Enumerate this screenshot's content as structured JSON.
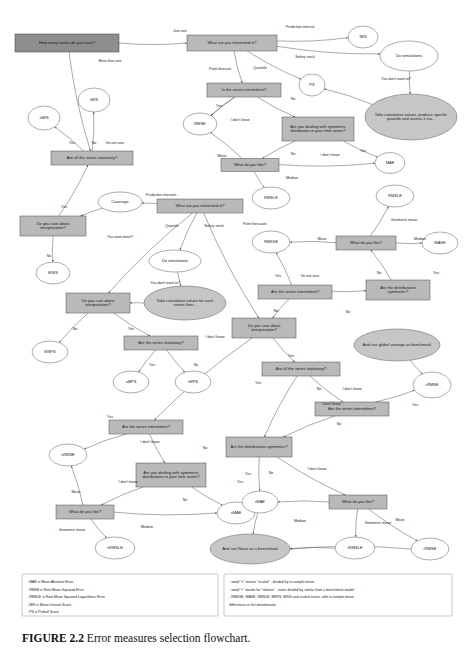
{
  "figure": {
    "caption_label": "FIGURE 2.2",
    "caption_text": "Error measures selection flowchart.",
    "bg": "#ffffff",
    "rect_fill": "#b9b9b9",
    "rect_dark_fill": "#8e8e8e",
    "ellipse_fill": "#ffffff",
    "ellipse_gray_fill": "#c6c6c6",
    "edge_color": "#555555"
  },
  "nodes": [
    {
      "id": "q_series_count",
      "label": "How many series do you have?",
      "shape": "rect-dark",
      "x": 67,
      "y": 43,
      "w": 104,
      "h": 18
    },
    {
      "id": "q_interested_top",
      "label": "What are you interested in?",
      "shape": "rect",
      "x": 232,
      "y": 43,
      "w": 90,
      "h": 16
    },
    {
      "id": "n_mis",
      "label": "MIS",
      "shape": "ellipse",
      "x": 363,
      "y": 37,
      "w": 30,
      "h": 22
    },
    {
      "id": "q_do_sim_top",
      "label": "Do simulations",
      "shape": "ellipse",
      "x": 409,
      "y": 56,
      "w": 58,
      "h": 30
    },
    {
      "id": "n_ps",
      "label": "PS",
      "shape": "ellipse",
      "x": 312,
      "y": 85,
      "w": 26,
      "h": 22
    },
    {
      "id": "n_take_cum_top",
      "label": "Take cumulative values, produce specific quantile and assess it via...",
      "shape": "ellipse-gray",
      "x": 411,
      "y": 117,
      "w": 92,
      "h": 46
    },
    {
      "id": "q_intermittent_top",
      "label": "Is the series intermittent?",
      "shape": "rect",
      "x": 244,
      "y": 90,
      "w": 74,
      "h": 14
    },
    {
      "id": "n_rmse_top",
      "label": "RMSE",
      "shape": "ellipse",
      "x": 200,
      "y": 124,
      "w": 34,
      "h": 22
    },
    {
      "id": "q_symmetric_top",
      "label": "Are you dealing with symmetric distribution in your time series?",
      "shape": "rect",
      "x": 318,
      "y": 129,
      "w": 72,
      "h": 24
    },
    {
      "id": "q_like_top",
      "label": "What do you like?",
      "shape": "rect",
      "x": 250,
      "y": 165,
      "w": 58,
      "h": 13
    },
    {
      "id": "n_mae_top",
      "label": "MAE",
      "shape": "ellipse",
      "x": 390,
      "y": 163,
      "w": 30,
      "h": 21
    },
    {
      "id": "n_rmsle_top",
      "label": "RMSLE",
      "shape": "ellipse",
      "x": 271,
      "y": 198,
      "w": 38,
      "h": 22
    },
    {
      "id": "n_rmis",
      "label": "rMIS",
      "shape": "ellipse",
      "x": 94,
      "y": 100,
      "w": 32,
      "h": 24
    },
    {
      "id": "n_smis",
      "label": "sMIS",
      "shape": "ellipse",
      "x": 44,
      "y": 118,
      "w": 32,
      "h": 24
    },
    {
      "id": "q_all_stationary_1",
      "label": "Are all the series stationary?",
      "shape": "rect",
      "x": 92,
      "y": 158,
      "w": 82,
      "h": 14
    },
    {
      "id": "q_care_interp_1",
      "label": "Do you care about interpretation?",
      "shape": "rect",
      "x": 53,
      "y": 226,
      "w": 66,
      "h": 20
    },
    {
      "id": "n_coverage",
      "label": "Coverage",
      "shape": "ellipse",
      "x": 120,
      "y": 202,
      "w": 44,
      "h": 20
    },
    {
      "id": "n_msis",
      "label": "MSIS",
      "shape": "ellipse",
      "x": 53,
      "y": 273,
      "w": 34,
      "h": 22
    },
    {
      "id": "q_interested_mid",
      "label": "What are you interested in?",
      "shape": "rect",
      "x": 200,
      "y": 206,
      "w": 86,
      "h": 14
    },
    {
      "id": "q_do_sim_mid",
      "label": "Do simulations",
      "shape": "ellipse",
      "x": 175,
      "y": 261,
      "w": 52,
      "h": 22
    },
    {
      "id": "n_take_cum_mid",
      "label": "Take cumulative values for each series then...",
      "shape": "ellipse-gray",
      "x": 185,
      "y": 303,
      "w": 82,
      "h": 34
    },
    {
      "id": "q_care_interp_2",
      "label": "Do you care about interpretation?",
      "shape": "rect",
      "x": 98,
      "y": 303,
      "w": 64,
      "h": 20
    },
    {
      "id": "n_msps",
      "label": "MSPS",
      "shape": "ellipse",
      "x": 50,
      "y": 352,
      "w": 36,
      "h": 22
    },
    {
      "id": "q_series_stationary_2",
      "label": "Are the series stationary?",
      "shape": "rect",
      "x": 161,
      "y": 343,
      "w": 74,
      "h": 14
    },
    {
      "id": "n_smps",
      "label": "sMPS",
      "shape": "ellipse",
      "x": 131,
      "y": 382,
      "w": 36,
      "h": 22
    },
    {
      "id": "n_rmps",
      "label": "rMPS",
      "shape": "ellipse",
      "x": 193,
      "y": 382,
      "w": 36,
      "h": 22
    },
    {
      "id": "n_rmsle_mid",
      "label": "RMSLE",
      "shape": "ellipse",
      "x": 395,
      "y": 196,
      "w": 38,
      "h": 22
    },
    {
      "id": "n_rmsse",
      "label": "RMSSE",
      "shape": "ellipse",
      "x": 271,
      "y": 242,
      "w": 38,
      "h": 22
    },
    {
      "id": "q_like_mid",
      "label": "What do you like?",
      "shape": "rect",
      "x": 366,
      "y": 243,
      "w": 60,
      "h": 14
    },
    {
      "id": "n_mase",
      "label": "MASE",
      "shape": "ellipse",
      "x": 440,
      "y": 243,
      "w": 36,
      "h": 22
    },
    {
      "id": "q_intermittent_mid",
      "label": "Are the series intermittent?",
      "shape": "rect",
      "x": 295,
      "y": 292,
      "w": 74,
      "h": 14
    },
    {
      "id": "q_distrib_sym_mid",
      "label": "Are the distributions symmetric?",
      "shape": "rect",
      "x": 398,
      "y": 290,
      "w": 64,
      "h": 20
    },
    {
      "id": "q_care_interp_3",
      "label": "Do you care about interpretation?",
      "shape": "rect",
      "x": 264,
      "y": 328,
      "w": 64,
      "h": 20
    },
    {
      "id": "n_global_avg",
      "label": "And use global average as benchmark",
      "shape": "ellipse-gray",
      "x": 397,
      "y": 345,
      "w": 86,
      "h": 32
    },
    {
      "id": "q_all_stationary_3",
      "label": "Are all the series stationary?",
      "shape": "rect",
      "x": 301,
      "y": 369,
      "w": 78,
      "h": 14
    },
    {
      "id": "n_rrmse_mid",
      "label": "rRMSE",
      "shape": "ellipse",
      "x": 432,
      "y": 385,
      "w": 38,
      "h": 26
    },
    {
      "id": "q_intermittent_low",
      "label": "Are the series intermittent?",
      "shape": "rect",
      "x": 352,
      "y": 409,
      "w": 74,
      "h": 14
    },
    {
      "id": "q_intermittent_bot",
      "label": "Are the series intermittent?",
      "shape": "rect",
      "x": 146,
      "y": 427,
      "w": 74,
      "h": 14
    },
    {
      "id": "n_srmse",
      "label": "sRMSE",
      "shape": "ellipse",
      "x": 68,
      "y": 455,
      "w": 38,
      "h": 22
    },
    {
      "id": "q_symmetric_bot",
      "label": "Are you dealing with symmetric distributions in your time series?",
      "shape": "rect",
      "x": 171,
      "y": 475,
      "w": 70,
      "h": 24
    },
    {
      "id": "q_like_bot",
      "label": "What do you like?",
      "shape": "rect",
      "x": 85,
      "y": 512,
      "w": 58,
      "h": 14
    },
    {
      "id": "n_smae",
      "label": "sMAE",
      "shape": "ellipse",
      "x": 236,
      "y": 513,
      "w": 38,
      "h": 22
    },
    {
      "id": "n_srmsle",
      "label": "sRMSLE",
      "shape": "ellipse",
      "x": 115,
      "y": 548,
      "w": 40,
      "h": 22
    },
    {
      "id": "q_distrib_sym_bot",
      "label": "Are the distributions symmetric?",
      "shape": "rect",
      "x": 259,
      "y": 447,
      "w": 66,
      "h": 20
    },
    {
      "id": "n_rmae",
      "label": "rMAE",
      "shape": "ellipse",
      "x": 260,
      "y": 502,
      "w": 36,
      "h": 22
    },
    {
      "id": "q_like_bot2",
      "label": "What do you like?",
      "shape": "rect",
      "x": 358,
      "y": 502,
      "w": 58,
      "h": 14
    },
    {
      "id": "n_rrmsle",
      "label": "rRMSLE",
      "shape": "ellipse",
      "x": 355,
      "y": 548,
      "w": 40,
      "h": 22
    },
    {
      "id": "n_naive_bench",
      "label": "And use Naive as a benchmark",
      "shape": "ellipse-gray",
      "x": 250,
      "y": 549,
      "w": 80,
      "h": 30
    },
    {
      "id": "n_rrmse_bot",
      "label": "rRMSE",
      "shape": "ellipse",
      "x": 430,
      "y": 549,
      "w": 38,
      "h": 22
    }
  ],
  "edge_labels": [
    {
      "text": "Just one",
      "x": 180,
      "y": 32
    },
    {
      "text": "More than one",
      "x": 110,
      "y": 62
    },
    {
      "text": "Prediction interval",
      "x": 300,
      "y": 28
    },
    {
      "text": "Safety stock",
      "x": 305,
      "y": 58
    },
    {
      "text": "Point forecast",
      "x": 220,
      "y": 70
    },
    {
      "text": "Quantile",
      "x": 260,
      "y": 69
    },
    {
      "text": "You don't want to?",
      "x": 396,
      "y": 80
    },
    {
      "text": "Yes",
      "x": 219,
      "y": 107
    },
    {
      "text": "No",
      "x": 293,
      "y": 100
    },
    {
      "text": "I don't know",
      "x": 240,
      "y": 121
    },
    {
      "text": "Yes",
      "x": 363,
      "y": 152
    },
    {
      "text": "No",
      "x": 293,
      "y": 155
    },
    {
      "text": "I don't know",
      "x": 330,
      "y": 156
    },
    {
      "text": "Mean",
      "x": 222,
      "y": 157
    },
    {
      "text": "Median",
      "x": 292,
      "y": 179
    },
    {
      "text": "Yes",
      "x": 72,
      "y": 144
    },
    {
      "text": "No",
      "x": 94,
      "y": 144
    },
    {
      "text": "I'm not sure",
      "x": 115,
      "y": 144
    },
    {
      "text": "Yes",
      "x": 64,
      "y": 208
    },
    {
      "text": "No",
      "x": 49,
      "y": 257
    },
    {
      "text": "You want more?",
      "x": 120,
      "y": 238
    },
    {
      "text": "Prediction intervals",
      "x": 161,
      "y": 196
    },
    {
      "text": "Quantile",
      "x": 172,
      "y": 227
    },
    {
      "text": "Safety stock",
      "x": 214,
      "y": 227
    },
    {
      "text": "Point forecasts",
      "x": 255,
      "y": 225
    },
    {
      "text": "You don't want to?",
      "x": 165,
      "y": 284
    },
    {
      "text": "No",
      "x": 75,
      "y": 330
    },
    {
      "text": "Yes",
      "x": 131,
      "y": 330
    },
    {
      "text": "I don't know",
      "x": 215,
      "y": 338
    },
    {
      "text": "Yes",
      "x": 152,
      "y": 366
    },
    {
      "text": "No",
      "x": 196,
      "y": 366
    },
    {
      "text": "Geometric mean",
      "x": 404,
      "y": 221
    },
    {
      "text": "Mean",
      "x": 322,
      "y": 240
    },
    {
      "text": "Median",
      "x": 420,
      "y": 240
    },
    {
      "text": "Yes",
      "x": 278,
      "y": 277
    },
    {
      "text": "I'm not sure",
      "x": 310,
      "y": 277
    },
    {
      "text": "No",
      "x": 379,
      "y": 274
    },
    {
      "text": "Yes",
      "x": 436,
      "y": 274
    },
    {
      "text": "No",
      "x": 276,
      "y": 312
    },
    {
      "text": "No",
      "x": 348,
      "y": 313
    },
    {
      "text": "Yes",
      "x": 291,
      "y": 357
    },
    {
      "text": "Yes",
      "x": 258,
      "y": 384
    },
    {
      "text": "No",
      "x": 319,
      "y": 390
    },
    {
      "text": "I don't know",
      "x": 352,
      "y": 390
    },
    {
      "text": "I don't know",
      "x": 331,
      "y": 405
    },
    {
      "text": "Yes",
      "x": 415,
      "y": 406
    },
    {
      "text": "No",
      "x": 339,
      "y": 425
    },
    {
      "text": "Yes",
      "x": 110,
      "y": 418
    },
    {
      "text": "I don't know",
      "x": 150,
      "y": 443
    },
    {
      "text": "No",
      "x": 205,
      "y": 449
    },
    {
      "text": "I don't know",
      "x": 128,
      "y": 483
    },
    {
      "text": "Yes",
      "x": 240,
      "y": 483
    },
    {
      "text": "No",
      "x": 185,
      "y": 501
    },
    {
      "text": "Mean",
      "x": 76,
      "y": 493
    },
    {
      "text": "Median",
      "x": 147,
      "y": 528
    },
    {
      "text": "Geometric mean",
      "x": 72,
      "y": 531
    },
    {
      "text": "Yes",
      "x": 248,
      "y": 475
    },
    {
      "text": "No",
      "x": 271,
      "y": 474
    },
    {
      "text": "I don't know",
      "x": 317,
      "y": 470
    },
    {
      "text": "Median",
      "x": 300,
      "y": 522
    },
    {
      "text": "Geometric mean",
      "x": 378,
      "y": 524
    },
    {
      "text": "Mean",
      "x": 400,
      "y": 521
    }
  ],
  "legend": {
    "left": [
      "- MAE is Mean Absolute Error,",
      "- RMSE is Root Mean Squared Error",
      "- RMSLE is Root Mean Squared Logarithmic Error",
      "- MIS is Mean Interval Score",
      "- PS is Pinball Score"
    ],
    "right": [
      "- small \"s\" means \"scaled\" - divided by in-sample mean",
      "- small \"r\" stands for \"relative\" - value divided by similar from a benchmark model",
      "- RMSSE, MASE, RMSLE, MSPS, MSIS and scaled errors, with in-sample mean",
      "  differences in the denominator"
    ]
  }
}
